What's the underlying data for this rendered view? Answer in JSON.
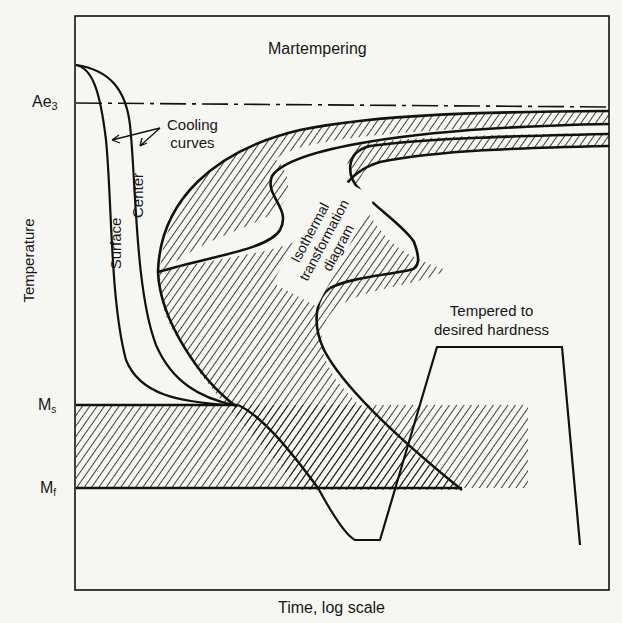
{
  "figure": {
    "title": "Martempering",
    "x_axis_label": "Time, log scale",
    "y_axis_label": "Temperature",
    "y_levels": {
      "ae3": {
        "base": "Ae",
        "sub": "3"
      },
      "ms": {
        "base": "M",
        "sub": "s"
      },
      "mf": {
        "base": "M",
        "sub": "f"
      }
    },
    "annotations": {
      "cooling_curves_line1": "Cooling",
      "cooling_curves_line2": "curves",
      "surface": "Surface",
      "center": "Center",
      "itd_line1": "Isothermal",
      "itd_line2": "transformation",
      "itd_line3": "diagram",
      "tempered_line1": "Tempered to",
      "tempered_line2": "desired hardness"
    },
    "colors": {
      "ink": "#111111",
      "paper": "#f6f6f3"
    }
  }
}
